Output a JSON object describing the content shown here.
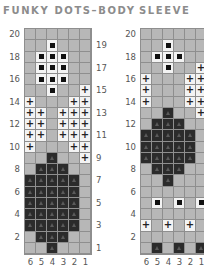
{
  "charts": [
    {
      "title": "FUNKY DOTS–BODY",
      "left_row_labels": [
        "20",
        "18",
        "16",
        "14",
        "12",
        "10",
        "8",
        "6",
        "4",
        "2"
      ],
      "right_row_labels": [
        "19",
        "17",
        "15",
        "13",
        "11",
        "9",
        "7",
        "5",
        "3",
        "1"
      ],
      "column_labels": [
        "6",
        "5",
        "4",
        "3",
        "2",
        "1"
      ],
      "rows": [
        "......",
        "..D...",
        ".DDD..",
        ".DDD..",
        ".DDD..",
        "..D..P",
        "P...PP",
        "PP.PPP",
        "PP.PPP",
        "PP.PPP",
        "P...PP",
        "..K..P",
        ".KKK..",
        "KKKKK.",
        "KKKKK.",
        "KKKKK.",
        "KKKKK.",
        "KKKKK.",
        ".KKK..",
        "..K..."
      ]
    },
    {
      "title": "SLEEVE",
      "left_row_labels": [
        "20",
        "18",
        "16",
        "14",
        "12",
        "10",
        "8",
        "6",
        "4",
        "2"
      ],
      "column_labels": [
        "6",
        "5",
        "4",
        "3",
        "2",
        "1"
      ],
      "rows": [
        "......",
        "..D...",
        ".DDD..",
        "..D..P",
        "P...PP",
        "P...PP",
        "P...PP",
        "..K..P",
        ".KKK..",
        "KKKKK.",
        "KKKKK.",
        "KKKKK.",
        ".KKK..",
        "..K...",
        "......",
        ".D.D.D",
        "......",
        "P.P.P.",
        "......",
        ".K.K.K"
      ]
    }
  ],
  "legend_symbols": {
    ".": "background-stitch",
    "D": "white-with-black-dot",
    "P": "white-with-plus",
    "K": "dark-with-triangle"
  },
  "colors": {
    "background_cell": "#b7b7b7",
    "grid_line": "#8e8e8e",
    "white_cell": "#f3f3f3",
    "dark_cell": "#2b2b2b",
    "title": "#8c8c8c"
  }
}
